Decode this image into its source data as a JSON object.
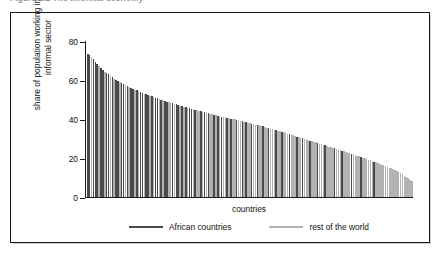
{
  "figure": {
    "caption": "Figure 2.1   The informal economy",
    "frame_color": "#1a1a1a",
    "background": "#ffffff"
  },
  "chart_data": {
    "type": "bar",
    "title": "",
    "xlabel": "countries",
    "ylabel": "share of population working in the informal sector",
    "ylim": [
      0,
      80
    ],
    "yticks": [
      0,
      20,
      40,
      60,
      80
    ],
    "ytick_labels": [
      "0",
      "20",
      "40",
      "60",
      "80"
    ],
    "xticks": [],
    "xtick_labels": [],
    "grid": false,
    "legend_position": "below-axis",
    "series": [
      {
        "name": "African countries",
        "color": "#4a4a4a"
      },
      {
        "name": "rest of the world",
        "color": "#b2b2b2"
      }
    ],
    "note": "Bars are sorted in descending order of informal-sector share; each bar is one country. group = 0 -> African countries (dark), 1 -> rest of the world (light).",
    "values": [
      73.4,
      72.6,
      71.8,
      70.9,
      69.4,
      68.2,
      67.1,
      66.0,
      65.2,
      64.3,
      63.5,
      62.8,
      62.0,
      61.3,
      60.6,
      60.0,
      59.4,
      58.8,
      58.2,
      57.7,
      57.2,
      56.8,
      56.3,
      55.9,
      55.4,
      55.0,
      54.6,
      54.2,
      53.8,
      53.4,
      53.0,
      52.6,
      52.2,
      51.9,
      51.5,
      51.2,
      50.8,
      50.5,
      50.1,
      49.8,
      49.5,
      49.2,
      48.9,
      48.6,
      48.3,
      48.0,
      47.7,
      47.4,
      47.1,
      46.8,
      46.5,
      46.2,
      46.0,
      45.7,
      45.4,
      45.1,
      44.9,
      44.6,
      44.3,
      44.1,
      43.8,
      43.6,
      43.3,
      43.1,
      42.8,
      42.6,
      42.3,
      42.1,
      41.9,
      41.6,
      41.4,
      41.2,
      41.0,
      40.8,
      40.6,
      40.4,
      40.1,
      39.9,
      39.7,
      39.5,
      39.3,
      39.0,
      38.8,
      38.6,
      38.3,
      38.1,
      37.9,
      37.6,
      37.4,
      37.1,
      36.9,
      36.6,
      36.3,
      36.1,
      35.8,
      35.5,
      35.3,
      35.0,
      34.7,
      34.4,
      34.1,
      33.9,
      33.6,
      33.3,
      33.0,
      32.7,
      32.4,
      32.1,
      31.8,
      31.5,
      31.2,
      30.9,
      30.6,
      30.3,
      30.0,
      29.7,
      29.4,
      29.1,
      28.8,
      28.5,
      28.2,
      27.9,
      27.6,
      27.3,
      27.0,
      26.7,
      26.4,
      26.1,
      25.8,
      25.5,
      25.1,
      24.8,
      24.5,
      24.2,
      23.9,
      23.6,
      23.3,
      23.0,
      22.6,
      22.3,
      22.0,
      21.7,
      21.4,
      21.0,
      20.7,
      20.4,
      20.1,
      19.7,
      19.4,
      19.0,
      18.7,
      18.3,
      18.0,
      17.6,
      17.2,
      16.9,
      16.5,
      16.1,
      15.7,
      15.3,
      14.9,
      14.5,
      14.0,
      13.6,
      13.1,
      12.6,
      12.1,
      11.5,
      10.9,
      10.2,
      9.5,
      8.8,
      8.0
    ],
    "group": [
      0,
      0,
      1,
      0,
      0,
      0,
      1,
      0,
      0,
      1,
      0,
      0,
      1,
      0,
      1,
      0,
      0,
      1,
      0,
      0,
      1,
      0,
      1,
      0,
      0,
      1,
      0,
      1,
      0,
      0,
      1,
      0,
      0,
      1,
      0,
      1,
      0,
      0,
      1,
      0,
      1,
      0,
      0,
      1,
      1,
      0,
      1,
      0,
      0,
      1,
      0,
      1,
      0,
      1,
      0,
      0,
      1,
      0,
      1,
      1,
      0,
      1,
      0,
      1,
      0,
      1,
      1,
      0,
      1,
      0,
      1,
      0,
      1,
      1,
      0,
      1,
      0,
      1,
      1,
      0,
      1,
      1,
      0,
      1,
      0,
      1,
      1,
      0,
      1,
      1,
      0,
      1,
      1,
      0,
      1,
      1,
      0,
      1,
      1,
      1,
      0,
      1,
      1,
      0,
      1,
      1,
      1,
      0,
      1,
      1,
      1,
      0,
      1,
      1,
      0,
      1,
      1,
      1,
      0,
      1,
      1,
      1,
      0,
      1,
      1,
      1,
      0,
      1,
      1,
      1,
      1,
      0,
      1,
      1,
      1,
      0,
      1,
      1,
      1,
      1,
      0,
      1,
      1,
      1,
      1,
      0,
      1,
      1,
      1,
      1,
      1,
      1,
      0,
      1,
      1,
      1,
      1,
      1,
      1,
      1,
      1,
      1,
      1,
      1,
      1,
      1,
      1,
      1,
      1,
      1,
      1,
      1,
      1
    ]
  },
  "legend": {
    "items": [
      {
        "label": "African countries",
        "color": "#4a4a4a"
      },
      {
        "label": "rest of the world",
        "color": "#b2b2b2"
      }
    ]
  }
}
